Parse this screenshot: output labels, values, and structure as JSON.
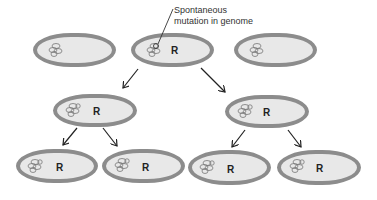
{
  "diagram": {
    "type": "bacterial-division-lineage",
    "callout": {
      "line1": "Spontaneous",
      "line2": "mutation in genome"
    },
    "resistance_label": "R",
    "colors": {
      "cell_fill": "#e8e8e8",
      "cell_border": "#8c8c8c",
      "arrow": "#222222",
      "text": "#333333"
    },
    "cells": [
      {
        "id": "top-left",
        "x": 33,
        "y": 33,
        "w": 83,
        "h": 34,
        "resistant": false,
        "label": ""
      },
      {
        "id": "top-middle",
        "x": 131,
        "y": 33,
        "w": 83,
        "h": 34,
        "resistant": true,
        "label": "R"
      },
      {
        "id": "top-right",
        "x": 234,
        "y": 33,
        "w": 83,
        "h": 34,
        "resistant": false,
        "label": ""
      },
      {
        "id": "middle-left",
        "x": 53,
        "y": 94,
        "w": 84,
        "h": 33,
        "resistant": true,
        "label": "R"
      },
      {
        "id": "middle-right",
        "x": 225,
        "y": 95,
        "w": 84,
        "h": 33,
        "resistant": true,
        "label": "R"
      },
      {
        "id": "bottom-1",
        "x": 16,
        "y": 149,
        "w": 82,
        "h": 34,
        "resistant": true,
        "label": "R"
      },
      {
        "id": "bottom-2",
        "x": 102,
        "y": 149,
        "w": 83,
        "h": 34,
        "resistant": true,
        "label": "R"
      },
      {
        "id": "bottom-3",
        "x": 188,
        "y": 150,
        "w": 83,
        "h": 35,
        "resistant": true,
        "label": "R"
      },
      {
        "id": "bottom-4",
        "x": 277,
        "y": 150,
        "w": 84,
        "h": 35,
        "resistant": true,
        "label": "R"
      }
    ],
    "arrows": [
      {
        "from": "top-middle",
        "to": "middle-left",
        "x1": 138,
        "y1": 69,
        "x2": 123,
        "y2": 88
      },
      {
        "from": "top-middle",
        "to": "middle-right",
        "x1": 201,
        "y1": 68,
        "x2": 225,
        "y2": 92
      },
      {
        "from": "middle-left",
        "to": "bottom-1",
        "x1": 77,
        "y1": 128,
        "x2": 63,
        "y2": 145
      },
      {
        "from": "middle-left",
        "to": "bottom-2",
        "x1": 103,
        "y1": 128,
        "x2": 117,
        "y2": 146
      },
      {
        "from": "middle-right",
        "to": "bottom-3",
        "x1": 245,
        "y1": 130,
        "x2": 232,
        "y2": 147
      },
      {
        "from": "middle-right",
        "to": "bottom-4",
        "x1": 288,
        "y1": 130,
        "x2": 301,
        "y2": 147
      }
    ]
  }
}
